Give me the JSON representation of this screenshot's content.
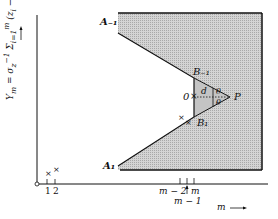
{
  "diagram": {
    "y_axis_label": "Y_m = σ_z⁻¹ Σ (z_i − μ₀)  →",
    "x_axis_label": "m ⟶",
    "x_ticks": [
      "1",
      "2",
      "m − 2",
      "m",
      "m − 1"
    ],
    "points": {
      "A_minus_1": "A₋₁",
      "A_1": "A₁",
      "B_minus_1": "B₋₁",
      "B_1": "B₁",
      "origin": "0",
      "P": "P",
      "d": "d",
      "theta_upper": "θ",
      "theta_lower": "θ"
    },
    "markers": [
      "×",
      "×",
      "×",
      "×",
      "×"
    ],
    "colors": {
      "shade": "#c8c8c8",
      "line": "#111111"
    }
  }
}
